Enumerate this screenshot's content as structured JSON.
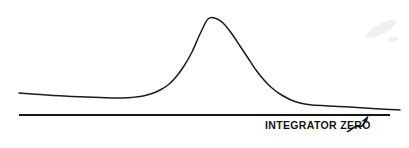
{
  "figure": {
    "background_color": "#ffffff",
    "width": 409,
    "height": 148,
    "annotation_label": "INTEGRATOR ZERO",
    "annotation_color": "#141414",
    "trace_color": "#1b1b1b",
    "baseline_color": "#161616",
    "arrow_color": "#151515",
    "smudge_color": "#f0f0f0"
  },
  "chart_data": {
    "type": "line",
    "title": "",
    "subtitle": "",
    "xlabel": "",
    "ylabel": "",
    "grid": false,
    "legend": "none",
    "xlim": [
      0,
      409
    ],
    "ylim": [
      148,
      0
    ],
    "annotations": [
      {
        "text": "INTEGRATOR ZERO",
        "x": 265,
        "y": 126,
        "points_to_x": 370,
        "points_to_y": 115,
        "arrow": "squiggly-up-right"
      }
    ],
    "series": [
      {
        "name": "detector-signal-trace",
        "description": "Chromatographic detector signal with a single gaussian peak riding on a drifting baseline",
        "x": [
          19,
          40,
          60,
          80,
          100,
          112,
          122,
          132,
          142,
          152,
          160,
          168,
          176,
          184,
          192,
          200,
          208,
          216,
          224,
          232,
          240,
          248,
          256,
          264,
          272,
          280,
          290,
          300,
          310,
          325,
          345,
          365,
          385,
          400
        ],
        "y": [
          93,
          94.5,
          95.8,
          96.8,
          97.6,
          97.9,
          97.9,
          97.4,
          96.2,
          93.5,
          90,
          85,
          77,
          66,
          52,
          34,
          19,
          18.5,
          24,
          34,
          46,
          58,
          70,
          80,
          88,
          94,
          99.5,
          103,
          104.8,
          105.8,
          106.8,
          108,
          109.3,
          110
        ]
      },
      {
        "name": "integrator-zero-baseline",
        "description": "Straight horizontal integrator zero reference line",
        "x": [
          19,
          390
        ],
        "y": [
          115,
          115
        ]
      }
    ]
  }
}
